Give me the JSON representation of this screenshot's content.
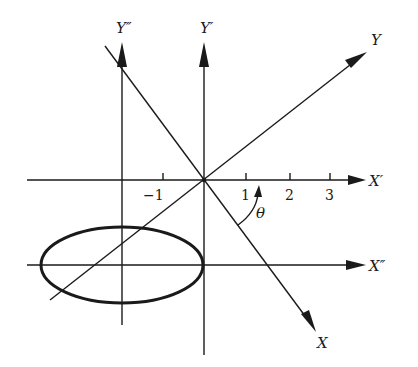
{
  "diagram": {
    "labels": {
      "x_rotated": "X",
      "y_rotated": "Y",
      "x_prime": "X′",
      "y_prime": "Y′",
      "x_double_prime": "X″",
      "y_double_prime": "Y″",
      "angle": "θ"
    },
    "ticks": [
      {
        "value": "−1",
        "x": 163
      },
      {
        "value": "1",
        "x": 246
      },
      {
        "value": "2",
        "x": 290
      },
      {
        "value": "3",
        "x": 330
      }
    ],
    "ellipse": {
      "cx": 122,
      "cy": 265,
      "rx": 81,
      "ry": 38
    },
    "colors": {
      "stroke": "#1a1a1a",
      "background": "#ffffff"
    }
  }
}
